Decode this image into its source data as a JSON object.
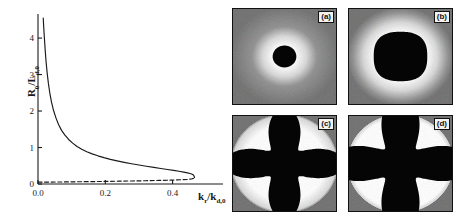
{
  "figure": {
    "kind": "scientific-figure"
  },
  "chart_data": {
    "type": "line",
    "title": "",
    "xlabel": "k_r/k_d,0",
    "ylabel": "R_0/L_d,0",
    "xlabel_base": "k",
    "xlabel_sub1": "r",
    "xlabel_slash": "/k",
    "xlabel_sub2": "d,0",
    "ylabel_base": "R",
    "ylabel_sub1": "0",
    "ylabel_slash": "/L",
    "ylabel_sub2": "d,0",
    "xlim": [
      0.0,
      0.52
    ],
    "ylim": [
      0.0,
      4.55
    ],
    "xticks": [
      0.0,
      0.2,
      0.4
    ],
    "xticklabels": [
      "0.0",
      "0.2",
      "0.4"
    ],
    "yticks": [
      0,
      1,
      2,
      3,
      4
    ],
    "yticklabels": [
      "0",
      "1",
      "2",
      "3",
      "4"
    ],
    "grid": false,
    "legend": false,
    "series": [
      {
        "name": "upper branch (stable)",
        "style": "solid",
        "color": "#1a1a1a",
        "x": [
          0.0155,
          0.017,
          0.019,
          0.0215,
          0.024,
          0.0275,
          0.031,
          0.035,
          0.04,
          0.046,
          0.053,
          0.061,
          0.07,
          0.08,
          0.091,
          0.103,
          0.116,
          0.13,
          0.145,
          0.161,
          0.178,
          0.196,
          0.215,
          0.235,
          0.256,
          0.278,
          0.3,
          0.322,
          0.344,
          0.365,
          0.385,
          0.403,
          0.419,
          0.433,
          0.444,
          0.452,
          0.458,
          0.462,
          0.464,
          0.465
        ],
        "y": [
          4.55,
          4.3,
          4.0,
          3.65,
          3.35,
          3.02,
          2.75,
          2.5,
          2.25,
          2.02,
          1.82,
          1.63,
          1.47,
          1.34,
          1.22,
          1.12,
          1.03,
          0.955,
          0.885,
          0.825,
          0.772,
          0.722,
          0.676,
          0.634,
          0.594,
          0.556,
          0.521,
          0.488,
          0.456,
          0.426,
          0.398,
          0.372,
          0.348,
          0.326,
          0.306,
          0.288,
          0.268,
          0.244,
          0.214,
          0.178
        ]
      },
      {
        "name": "lower branch (unstable)",
        "style": "dashed",
        "color": "#1a1a1a",
        "x": [
          0.0,
          0.04,
          0.08,
          0.12,
          0.16,
          0.2,
          0.24,
          0.28,
          0.32,
          0.36,
          0.4,
          0.425,
          0.444,
          0.456,
          0.462,
          0.465
        ],
        "y": [
          0.05,
          0.053,
          0.057,
          0.061,
          0.066,
          0.071,
          0.077,
          0.083,
          0.09,
          0.098,
          0.108,
          0.116,
          0.125,
          0.137,
          0.155,
          0.178
        ]
      }
    ],
    "turning_point": {
      "x": 0.465,
      "y": 0.178
    }
  },
  "panels": [
    {
      "id": "a",
      "label": "(a)",
      "shape": "circle",
      "shape_desc": "small dark circular domain with bright halo",
      "radius": 0.115,
      "lobes": 0
    },
    {
      "id": "b",
      "label": "(b)",
      "shape": "rounded-diamond",
      "shape_desc": "dark rounded diamond domain with bright halo",
      "radius": 0.26,
      "lobes": 0
    },
    {
      "id": "c",
      "label": "(c)",
      "shape": "four-lobe-clover",
      "shape_desc": "four-lobed cloverleaf domain with bright halo",
      "radius": 0.4,
      "lobes": 4
    },
    {
      "id": "d",
      "label": "(d)",
      "shape": "four-lobe-clover-large",
      "shape_desc": "larger four-lobed cloverleaf domain with bright halo",
      "radius": 0.48,
      "lobes": 4
    }
  ],
  "colors": {
    "axis": "#1a1a1a",
    "curve": "#1a1a1a",
    "panel_background": "#6e6e6e",
    "panel_domain": "#050505",
    "panel_halo": "#f2f2f2",
    "panel_border": "#111111",
    "label_box": "#f2f2f2"
  }
}
